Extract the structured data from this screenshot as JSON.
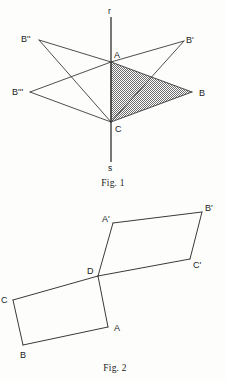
{
  "page": {
    "width": 226,
    "height": 380,
    "background": "#fdfdfc",
    "ink_color": "#3a3a3a"
  },
  "figure1": {
    "caption": "Fig. 1",
    "axis": {
      "top_label": "r",
      "bottom_label": "s",
      "description": "vertical axis line r-s through A and C"
    },
    "points": {
      "A": {
        "label": "A",
        "x": 111,
        "y": 62,
        "label_x": 114,
        "label_y": 58
      },
      "B": {
        "label": "B",
        "x": 192,
        "y": 92,
        "label_x": 199,
        "label_y": 95
      },
      "C": {
        "label": "C",
        "x": 111,
        "y": 122,
        "label_x": 115,
        "label_y": 130
      },
      "B1": {
        "label": "B'",
        "x": 184,
        "y": 41,
        "label_x": 188,
        "label_y": 40
      },
      "B2": {
        "label": "B''",
        "x": 39,
        "y": 40,
        "label_x": 25,
        "label_y": 39
      },
      "B3": {
        "label": "B'''",
        "x": 30,
        "y": 92,
        "label_x": 17,
        "label_y": 92
      }
    },
    "shaded_triangle": {
      "vertices": "A,B,C",
      "fill_pattern": "cross-hatch-stipple",
      "fill_color": "#6e6e6e"
    },
    "edges": [
      "A-B",
      "B-C",
      "C-A",
      "A-B'",
      "B'-C",
      "A-B''",
      "B''-C",
      "A-B'''",
      "B'''-C"
    ]
  },
  "figure2": {
    "caption": "Fig. 2",
    "points": {
      "A": {
        "label": "A",
        "x": 108,
        "y": 327,
        "label_x": 116,
        "label_y": 330
      },
      "B": {
        "label": "B",
        "x": 23,
        "y": 345,
        "label_x": 23,
        "label_y": 357
      },
      "C": {
        "label": "C",
        "x": 13,
        "y": 300,
        "label_x": 3,
        "label_y": 301
      },
      "D": {
        "label": "D",
        "x": 98,
        "y": 276,
        "label_x": 90,
        "label_y": 273
      },
      "A1": {
        "label": "A'",
        "x": 113,
        "y": 223,
        "label_x": 104,
        "label_y": 221
      },
      "B1": {
        "label": "B'",
        "x": 202,
        "y": 212,
        "label_x": 207,
        "label_y": 210
      },
      "C1": {
        "label": "C'",
        "x": 190,
        "y": 259,
        "label_x": 195,
        "label_y": 266
      }
    },
    "parallelograms": [
      {
        "name": "lower",
        "vertices": "C,D,A,B"
      },
      {
        "name": "upper",
        "vertices": "D,A',B',C'"
      }
    ]
  }
}
